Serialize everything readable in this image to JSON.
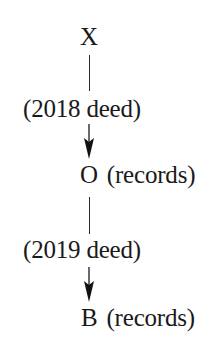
{
  "diagram": {
    "type": "chain-of-title",
    "nodes": [
      {
        "id": "X",
        "name": "X",
        "note": ""
      },
      {
        "id": "O",
        "name": "O",
        "note": "(records)"
      },
      {
        "id": "B",
        "name": "B",
        "note": "(records)"
      }
    ],
    "edges": [
      {
        "from": "X",
        "to": "O",
        "label": "(2018 deed)",
        "directed": true
      },
      {
        "from": "O",
        "to": "B",
        "label": "(2019 deed)",
        "directed": true
      }
    ],
    "colors": {
      "ink": "#1a1a1a",
      "background": "#ffffff"
    }
  }
}
